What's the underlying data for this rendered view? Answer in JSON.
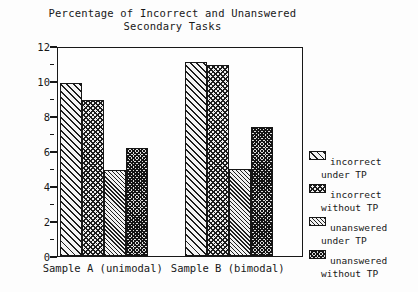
{
  "chart_data": {
    "type": "bar",
    "title": "Percentage of Incorrect and Unanswered Secondary Tasks",
    "title_line1": "Percentage of Incorrect and Unanswered",
    "title_line2": "Secondary Tasks",
    "xlabel": "",
    "ylabel": "",
    "ylim": [
      0,
      12
    ],
    "ytick_labels": [
      "0",
      "2",
      "4",
      "6",
      "8",
      "10",
      "12"
    ],
    "ytick_values": [
      0,
      2,
      4,
      6,
      8,
      10,
      12
    ],
    "yminor_values": [
      1,
      3,
      5,
      7,
      9,
      11
    ],
    "grid": false,
    "legend_position": "right",
    "categories": [
      "Sample A (unimodal)",
      "Sample B (bimodal)"
    ],
    "series": [
      {
        "name": "incorrect under TP",
        "name_line1": "incorrect",
        "name_line2": "under TP",
        "pattern": "diag-coarse",
        "values": [
          9.9,
          11.1
        ]
      },
      {
        "name": "incorrect without TP",
        "name_line1": "incorrect",
        "name_line2": "without TP",
        "pattern": "checker",
        "values": [
          8.9,
          10.9
        ]
      },
      {
        "name": "unanswered under TP",
        "name_line1": "unanswered",
        "name_line2": "under TP",
        "pattern": "diag-fine",
        "values": [
          4.9,
          5.0
        ]
      },
      {
        "name": "unanswered without TP",
        "name_line1": "unanswered",
        "name_line2": "without TP",
        "pattern": "checker-dense",
        "values": [
          6.2,
          7.4
        ]
      }
    ],
    "bar_fill_order": [
      "checker-dense",
      "diag-fine",
      "checker",
      "diag-coarse"
    ],
    "colors": {
      "axis": "#181818",
      "bar_outline": "#161616",
      "background": "#ffffff",
      "text": "#181818"
    }
  }
}
